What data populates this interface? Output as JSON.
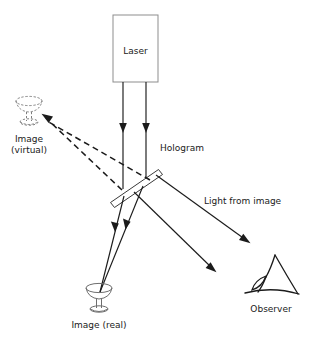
{
  "diagram": {
    "background_color": "#ffffff",
    "line_color": "#1b1b1b",
    "glass_color": "#6e6e6e",
    "box_color": "#8d8d8d",
    "labels": {
      "laser": "Laser",
      "hologram": "Hologram",
      "image_virtual_line1": "Image",
      "image_virtual_line2": "(virtual)",
      "image_real": "Image (real)",
      "light_from_image": "Light from image",
      "observer": "Observer"
    },
    "components": [
      {
        "name": "laser-source",
        "label": "Laser",
        "shape": "rectangle"
      },
      {
        "name": "hologram-plate",
        "label": "Hologram",
        "shape": "tilted-plate"
      },
      {
        "name": "virtual-image-goblet",
        "label": "Image (virtual)",
        "shape": "goblet",
        "line_style": "dashed"
      },
      {
        "name": "real-image-goblet",
        "label": "Image (real)",
        "shape": "goblet",
        "line_style": "solid"
      },
      {
        "name": "observer-eye",
        "label": "Observer",
        "shape": "eye-profile"
      }
    ],
    "rays": [
      {
        "name": "laser-beam-left",
        "style": "solid",
        "arrow": true
      },
      {
        "name": "laser-beam-right",
        "style": "solid",
        "arrow": true
      },
      {
        "name": "virtual-ray-upper",
        "style": "dashed",
        "arrow": true
      },
      {
        "name": "virtual-ray-lower",
        "style": "dashed",
        "arrow": false
      },
      {
        "name": "real-image-ray-left",
        "style": "solid",
        "arrow": true
      },
      {
        "name": "real-image-ray-right",
        "style": "solid",
        "arrow": true
      },
      {
        "name": "observer-ray-upper",
        "style": "solid",
        "arrow": true
      },
      {
        "name": "observer-ray-lower",
        "style": "solid",
        "arrow": true
      }
    ]
  }
}
